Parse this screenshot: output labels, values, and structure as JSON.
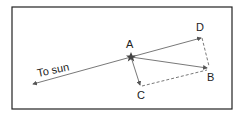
{
  "diagram": {
    "labels": {
      "a": "A",
      "b": "B",
      "c": "C",
      "d": "D",
      "sun": "To sun"
    },
    "colors": {
      "line": "#555555",
      "border": "#222222",
      "star": "#444444"
    }
  }
}
